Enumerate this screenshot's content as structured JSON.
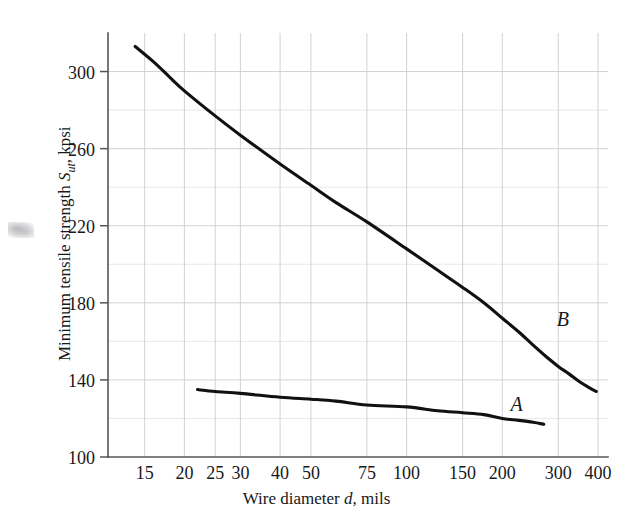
{
  "figure": {
    "background_color": "#ffffff",
    "ink_color": "#111111",
    "grid_color": "#c9cdd2",
    "axis_color": "#55565a"
  },
  "chart_data": {
    "type": "line",
    "title": "",
    "xlabel": "Wire diameter d, mils",
    "ylabel": "Minimum tensile strength S_ut, kpsi",
    "xscale": "log",
    "yscale": "linear",
    "xlim": [
      11.5,
      430
    ],
    "ylim": [
      100,
      320
    ],
    "grid": true,
    "legend": "none",
    "xticks": [
      15,
      20,
      25,
      30,
      40,
      50,
      75,
      100,
      150,
      200,
      300,
      400
    ],
    "xtick_labels": [
      "15",
      "20",
      "25",
      "30",
      "40",
      "50",
      "75",
      "100",
      "150",
      "200",
      "300",
      "400"
    ],
    "yticks": [
      100,
      140,
      180,
      220,
      260,
      300
    ],
    "ytick_labels": [
      "100",
      "140",
      "180",
      "220",
      "260",
      "300"
    ],
    "yminor_ticks": [
      120,
      160,
      200,
      240,
      280
    ],
    "series": [
      {
        "name": "B",
        "label": "B",
        "label_point": [
          310,
          168
        ],
        "points": [
          [
            14.0,
            313
          ],
          [
            16.0,
            305
          ],
          [
            18.0,
            297
          ],
          [
            20.0,
            290
          ],
          [
            25.0,
            277
          ],
          [
            30.0,
            267
          ],
          [
            40.0,
            252
          ],
          [
            50.0,
            241
          ],
          [
            60.0,
            232
          ],
          [
            75.0,
            222
          ],
          [
            100.0,
            208
          ],
          [
            125.0,
            197
          ],
          [
            150.0,
            188
          ],
          [
            175.0,
            180
          ],
          [
            200.0,
            172
          ],
          [
            225.0,
            165
          ],
          [
            250.0,
            158
          ],
          [
            275.0,
            152
          ],
          [
            300.0,
            147
          ],
          [
            325.0,
            143
          ],
          [
            350.0,
            139
          ],
          [
            375.0,
            136
          ],
          [
            395.0,
            134
          ]
        ]
      },
      {
        "name": "A",
        "label": "A",
        "label_point": [
          222,
          124
        ],
        "points": [
          [
            22.0,
            135
          ],
          [
            25.0,
            134
          ],
          [
            30.0,
            133
          ],
          [
            40.0,
            131
          ],
          [
            50.0,
            130
          ],
          [
            60.0,
            129
          ],
          [
            75.0,
            127
          ],
          [
            100.0,
            126
          ],
          [
            125.0,
            124
          ],
          [
            150.0,
            123
          ],
          [
            175.0,
            122
          ],
          [
            200.0,
            120
          ],
          [
            225.0,
            119
          ],
          [
            250.0,
            118
          ],
          [
            270.0,
            117
          ]
        ]
      }
    ]
  },
  "axis_titles": {
    "x_prefix": "Wire diameter ",
    "x_var": "d",
    "x_suffix": ", mils",
    "y_prefix": "Minimum tensile strength ",
    "y_var": "S",
    "y_sub": "ut",
    "y_suffix": ", kpsi"
  }
}
